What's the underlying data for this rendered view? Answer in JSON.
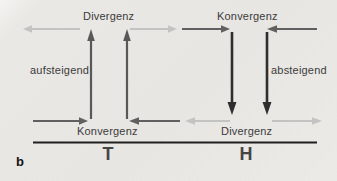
{
  "figure": {
    "label": "b",
    "type": "pressure-system-circulation-diagram"
  },
  "upper_level": {
    "left_label": "Divergenz",
    "right_label": "Konvergenz"
  },
  "vertical_motion": {
    "left_label": "aufsteigend",
    "right_label": "absteigend"
  },
  "surface_level": {
    "left_label": "Konvergenz",
    "right_label": "Divergenz"
  },
  "pressure_systems": {
    "low": "T",
    "high": "H"
  },
  "colors": {
    "panel_background": "#e8e6e3",
    "light_arrow": "#c3c3c1",
    "dark_arrow": "#606060",
    "ascending_arrow": "#585858",
    "descending_arrow": "#2e2e2e",
    "baseline": "#1f1f1f",
    "text": "#3b3b3b"
  }
}
